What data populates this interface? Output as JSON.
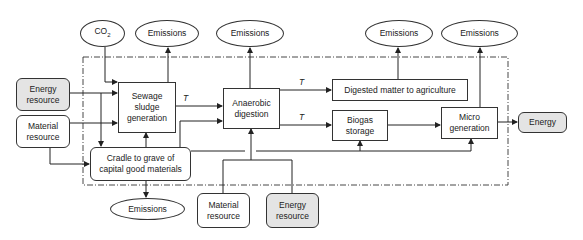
{
  "diagram": {
    "title": "",
    "boundary": "dash-dot system boundary",
    "nodes": {
      "co2": {
        "label": "CO",
        "sub": "2",
        "shape": "ellipse"
      },
      "emissions_sewage": {
        "label": "Emissions",
        "shape": "ellipse"
      },
      "emissions_anaerobic": {
        "label": "Emissions",
        "shape": "ellipse"
      },
      "emissions_digested": {
        "label": "Emissions",
        "shape": "ellipse"
      },
      "emissions_micro": {
        "label": "Emissions",
        "shape": "ellipse"
      },
      "emissions_cradle": {
        "label": "Emissions",
        "shape": "ellipse"
      },
      "energy_resource_left": {
        "label_line1": "Energy",
        "label_line2": "resource",
        "shape": "rounded",
        "fill": "#e4e4e4"
      },
      "material_resource_left": {
        "label_line1": "Material",
        "label_line2": "resource",
        "shape": "rounded"
      },
      "sewage_sludge": {
        "label_line1": "Sewage",
        "label_line2": "sludge",
        "label_line3": "generation",
        "shape": "rect"
      },
      "cradle_to_grave": {
        "label_line1": "Cradle to grave of",
        "label_line2": "capital good materials",
        "shape": "rounded"
      },
      "anaerobic_digestion": {
        "label_line1": "Anaerobic",
        "label_line2": "digestion",
        "shape": "rect"
      },
      "digested_matter": {
        "label": "Digested matter to agriculture",
        "shape": "rect"
      },
      "biogas_storage": {
        "label_line1": "Biogas",
        "label_line2": "storage",
        "shape": "rect"
      },
      "micro_generation": {
        "label_line1": "Micro",
        "label_line2": "generation",
        "shape": "rect"
      },
      "energy_output": {
        "label": "Energy",
        "shape": "rounded",
        "fill": "#e4e4e4"
      },
      "material_resource_bottom": {
        "label_line1": "Material",
        "label_line2": "resource",
        "shape": "rounded"
      },
      "energy_resource_bottom": {
        "label_line1": "Energy",
        "label_line2": "resource",
        "shape": "rounded",
        "fill": "#e4e4e4"
      }
    },
    "edge_labels": {
      "t1": "T",
      "t2": "T",
      "t3": "T"
    },
    "edges": [
      {
        "from": "co2",
        "to": "sewage_sludge"
      },
      {
        "from": "sewage_sludge",
        "to": "emissions_sewage"
      },
      {
        "from": "energy_resource_left",
        "to": "sewage_sludge"
      },
      {
        "from": "material_resource_left",
        "to": "sewage_sludge"
      },
      {
        "from": "energy_resource_left",
        "to": "cradle_to_grave"
      },
      {
        "from": "material_resource_left",
        "to": "cradle_to_grave"
      },
      {
        "from": "cradle_to_grave",
        "to": "sewage_sludge"
      },
      {
        "from": "cradle_to_grave",
        "to": "emissions_cradle"
      },
      {
        "from": "sewage_sludge",
        "to": "anaerobic_digestion",
        "label": "T"
      },
      {
        "from": "cradle_to_grave",
        "to": "anaerobic_digestion"
      },
      {
        "from": "anaerobic_digestion",
        "to": "emissions_anaerobic"
      },
      {
        "from": "anaerobic_digestion",
        "to": "digested_matter",
        "label": "T"
      },
      {
        "from": "anaerobic_digestion",
        "to": "biogas_storage",
        "label": "T"
      },
      {
        "from": "digested_matter",
        "to": "emissions_digested"
      },
      {
        "from": "biogas_storage",
        "to": "micro_generation"
      },
      {
        "from": "micro_generation",
        "to": "emissions_micro"
      },
      {
        "from": "micro_generation",
        "to": "energy_output"
      },
      {
        "from": "cradle_to_grave",
        "to": "biogas_storage"
      },
      {
        "from": "cradle_to_grave",
        "to": "micro_generation"
      },
      {
        "from": "material_resource_bottom",
        "to": "anaerobic_digestion"
      },
      {
        "from": "energy_resource_bottom",
        "to": "anaerobic_digestion"
      }
    ]
  }
}
